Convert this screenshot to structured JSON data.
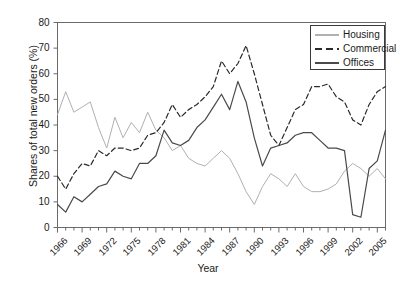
{
  "chart_data": {
    "type": "line",
    "title": "",
    "xlabel": "Year",
    "ylabel": "Shares of total new orders (%)",
    "xlim": [
      1966,
      2006
    ],
    "ylim": [
      0,
      80
    ],
    "ytick_step": 10,
    "yticks": [
      0,
      10,
      20,
      30,
      40,
      50,
      60,
      70,
      80
    ],
    "xtick_labels": [
      "1966",
      "1969",
      "1972",
      "1975",
      "1978",
      "1981",
      "1984",
      "1987",
      "1990",
      "1993",
      "1996",
      "1999",
      "2002",
      "2005"
    ],
    "xtick_years": [
      1966,
      1969,
      1972,
      1975,
      1978,
      1981,
      1984,
      1987,
      1990,
      1993,
      1996,
      1999,
      2002,
      2005
    ],
    "minor_ticks": "every year",
    "grid": false,
    "legend_position": "top-right",
    "x": [
      1966,
      1967,
      1968,
      1969,
      1970,
      1971,
      1972,
      1973,
      1974,
      1975,
      1976,
      1977,
      1978,
      1979,
      1980,
      1981,
      1982,
      1983,
      1984,
      1985,
      1986,
      1987,
      1988,
      1989,
      1990,
      1991,
      1992,
      1993,
      1994,
      1995,
      1996,
      1997,
      1998,
      1999,
      2000,
      2001,
      2002,
      2003,
      2004,
      2005,
      2006
    ],
    "series": [
      {
        "name": "Housing",
        "color": "#b0b0b0",
        "dash": "solid",
        "values": [
          44,
          53,
          45,
          47,
          49,
          39,
          31,
          43,
          35,
          41,
          37,
          45,
          38,
          35,
          30,
          32,
          27,
          25,
          24,
          27,
          30,
          27,
          21,
          14,
          9,
          16,
          21,
          19,
          16,
          21,
          16,
          14,
          14,
          15,
          17,
          22,
          25,
          23,
          20,
          23,
          19
        ]
      },
      {
        "name": "Commercial",
        "color": "#2a2a2a",
        "dash": "dashed",
        "values": [
          20,
          15,
          21,
          25,
          24,
          30,
          28,
          31,
          31,
          30,
          31,
          36,
          37,
          41,
          48,
          43,
          46,
          48,
          51,
          55,
          65,
          60,
          64,
          71,
          60,
          48,
          36,
          32,
          39,
          46,
          48,
          55,
          55,
          56,
          51,
          49,
          42,
          40,
          48,
          53,
          55
        ]
      },
      {
        "name": "Offices",
        "color": "#4a4a4a",
        "dash": "solid",
        "values": [
          9,
          6,
          12,
          10,
          13,
          16,
          17,
          22,
          20,
          19,
          25,
          25,
          28,
          38,
          33,
          32,
          34,
          39,
          42,
          47,
          52,
          46,
          57,
          49,
          35,
          24,
          31,
          32,
          33,
          36,
          37,
          37,
          34,
          31,
          31,
          30,
          5,
          4,
          23,
          26,
          38
        ]
      }
    ]
  }
}
